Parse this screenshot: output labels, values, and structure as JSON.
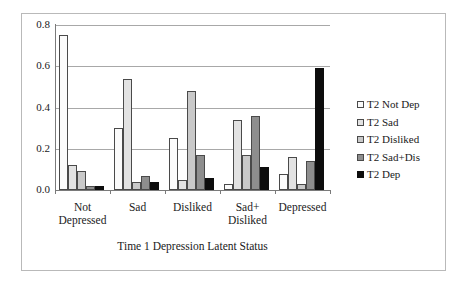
{
  "chart_data": {
    "type": "bar",
    "title": "",
    "subtitle": "",
    "xlabel": "Time 1 Depression Latent Status",
    "ylabel": "",
    "ylim": [
      0.0,
      0.8
    ],
    "yticks": [
      "0.0",
      "0.2",
      "0.4",
      "0.6",
      "0.8"
    ],
    "ytick_values": [
      0.0,
      0.2,
      0.4,
      0.6,
      0.8
    ],
    "grid": true,
    "legend_position": "right",
    "categories": [
      "Not Depressed",
      "Sad",
      "Disliked",
      "Sad+ Disliked",
      "Depressed"
    ],
    "category_lines": [
      [
        "Not",
        "Depressed"
      ],
      [
        "Sad",
        ""
      ],
      [
        "Disliked",
        ""
      ],
      [
        "Sad+",
        "Disliked"
      ],
      [
        "Depressed",
        ""
      ]
    ],
    "series": [
      {
        "name": "T2 Not Dep",
        "color": "#fbfbfb",
        "values": [
          0.75,
          0.3,
          0.25,
          0.03,
          0.08
        ]
      },
      {
        "name": "T2 Sad",
        "color": "#e2e2e2",
        "values": [
          0.12,
          0.54,
          0.05,
          0.34,
          0.16
        ]
      },
      {
        "name": "T2 Disliked",
        "color": "#c9c9c9",
        "values": [
          0.09,
          0.04,
          0.48,
          0.17,
          0.03
        ]
      },
      {
        "name": "T2 Sad+Dis",
        "color": "#8e8e8e",
        "values": [
          0.02,
          0.07,
          0.17,
          0.36,
          0.14
        ]
      },
      {
        "name": "T2 Dep",
        "color": "#0d0d0d",
        "values": [
          0.02,
          0.04,
          0.06,
          0.11,
          0.59
        ]
      }
    ]
  },
  "legend": {
    "items": [
      {
        "label": "T2 Not Dep"
      },
      {
        "label": "T2 Sad"
      },
      {
        "label": "T2 Disliked"
      },
      {
        "label": "T2 Sad+Dis"
      },
      {
        "label": "T2 Dep"
      }
    ]
  }
}
